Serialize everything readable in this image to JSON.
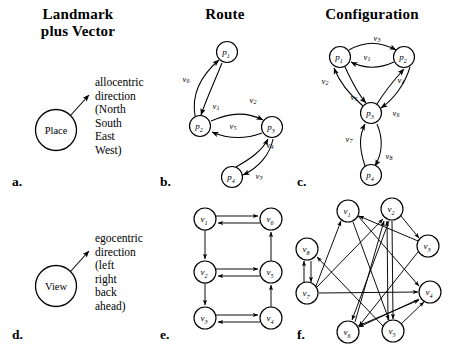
{
  "headers": {
    "landmark": "Landmark\nplus Vector",
    "route": "Route",
    "configuration": "Configuration"
  },
  "panel_labels": {
    "a": "a.",
    "b": "b.",
    "c": "c.",
    "d": "d.",
    "e": "e.",
    "f": "f."
  },
  "panel_a": {
    "node_label": "Place",
    "caption": "allocentric\ndirection\n(North\nSouth\nEast\nWest)"
  },
  "panel_d": {
    "node_label": "View",
    "caption": "egocentric\ndirection\n(left\nright\nback\nahead)"
  },
  "chart_data": [
    {
      "type": "diagram",
      "id": "panel_b",
      "title": "Route",
      "graph_kind": "directed-graph",
      "nodes": [
        {
          "id": "p1",
          "label": "p",
          "sub": "1",
          "x": 227,
          "y": 52
        },
        {
          "id": "p2",
          "label": "p",
          "sub": "2",
          "x": 200,
          "y": 126
        },
        {
          "id": "p3",
          "label": "p",
          "sub": "3",
          "x": 272,
          "y": 127
        },
        {
          "id": "p4",
          "label": "p",
          "sub": "4",
          "x": 232,
          "y": 177
        }
      ],
      "edges": [
        {
          "from": "p1",
          "to": "p2",
          "label": "v",
          "sub": "1"
        },
        {
          "from": "p2",
          "to": "p1",
          "label": "v",
          "sub": "6"
        },
        {
          "from": "p2",
          "to": "p3",
          "label": "v",
          "sub": "2"
        },
        {
          "from": "p3",
          "to": "p2",
          "label": "v",
          "sub": "5"
        },
        {
          "from": "p3",
          "to": "p4",
          "label": "v",
          "sub": "3"
        },
        {
          "from": "p4",
          "to": "p3",
          "label": "v",
          "sub": "4"
        }
      ],
      "edge_labels": [
        "v1",
        "v2",
        "v3",
        "v4",
        "v5",
        "v6"
      ]
    },
    {
      "type": "diagram",
      "id": "panel_c",
      "title": "Configuration",
      "graph_kind": "directed-graph",
      "nodes": [
        {
          "id": "p1",
          "label": "p",
          "sub": "1",
          "x": 340,
          "y": 57
        },
        {
          "id": "p2",
          "label": "p",
          "sub": "2",
          "x": 404,
          "y": 57
        },
        {
          "id": "p3",
          "label": "p",
          "sub": "3",
          "x": 371,
          "y": 113
        },
        {
          "id": "p4",
          "label": "p",
          "sub": "4",
          "x": 371,
          "y": 175
        }
      ],
      "edges": [
        {
          "from": "p1",
          "to": "p2",
          "label": "v",
          "sub": "3"
        },
        {
          "from": "p2",
          "to": "p1",
          "label": "v",
          "sub": "1"
        },
        {
          "from": "p3",
          "to": "p1",
          "label": "v",
          "sub": "2"
        },
        {
          "from": "p1",
          "to": "p3",
          "label": "v",
          "sub": "5"
        },
        {
          "from": "p3",
          "to": "p2",
          "label": "v",
          "sub": "4"
        },
        {
          "from": "p2",
          "to": "p3",
          "label": "v",
          "sub": "6"
        },
        {
          "from": "p4",
          "to": "p3",
          "label": "v",
          "sub": "7"
        },
        {
          "from": "p3",
          "to": "p4",
          "label": "v",
          "sub": "8"
        }
      ],
      "edge_labels": [
        "v1",
        "v2",
        "v3",
        "v4",
        "v5",
        "v6",
        "v7",
        "v8"
      ]
    },
    {
      "type": "diagram",
      "id": "panel_e",
      "title": "",
      "graph_kind": "directed-graph",
      "nodes": [
        {
          "id": "v1",
          "label": "v",
          "sub": "1",
          "x": 205,
          "y": 219
        },
        {
          "id": "v6",
          "label": "v",
          "sub": "6",
          "x": 271,
          "y": 219
        },
        {
          "id": "v2",
          "label": "v",
          "sub": "2",
          "x": 205,
          "y": 272
        },
        {
          "id": "v5",
          "label": "v",
          "sub": "5",
          "x": 271,
          "y": 272
        },
        {
          "id": "v3",
          "label": "v",
          "sub": "3",
          "x": 205,
          "y": 318
        },
        {
          "id": "v4",
          "label": "v",
          "sub": "4",
          "x": 271,
          "y": 318
        }
      ],
      "edges": [
        {
          "from": "v1",
          "to": "v6"
        },
        {
          "from": "v6",
          "to": "v1"
        },
        {
          "from": "v1",
          "to": "v2"
        },
        {
          "from": "v2",
          "to": "v5"
        },
        {
          "from": "v5",
          "to": "v2"
        },
        {
          "from": "v5",
          "to": "v6"
        },
        {
          "from": "v2",
          "to": "v3"
        },
        {
          "from": "v3",
          "to": "v4"
        },
        {
          "from": "v4",
          "to": "v3"
        },
        {
          "from": "v4",
          "to": "v5"
        }
      ]
    },
    {
      "type": "diagram",
      "id": "panel_f",
      "title": "",
      "graph_kind": "directed-graph",
      "nodes": [
        {
          "id": "v1",
          "label": "v",
          "sub": "1",
          "x": 348,
          "y": 211
        },
        {
          "id": "v2",
          "label": "v",
          "sub": "2",
          "x": 392,
          "y": 209
        },
        {
          "id": "v8",
          "label": "v",
          "sub": "8",
          "x": 307,
          "y": 249
        },
        {
          "id": "v3",
          "label": "v",
          "sub": "3",
          "x": 428,
          "y": 246
        },
        {
          "id": "v7",
          "label": "v",
          "sub": "7",
          "x": 307,
          "y": 293
        },
        {
          "id": "v4",
          "label": "v",
          "sub": "4",
          "x": 430,
          "y": 292
        },
        {
          "id": "v6",
          "label": "v",
          "sub": "6",
          "x": 348,
          "y": 332
        },
        {
          "id": "v5",
          "label": "v",
          "sub": "5",
          "x": 393,
          "y": 331
        }
      ],
      "edges": [
        {
          "from": "v8",
          "to": "v7"
        },
        {
          "from": "v7",
          "to": "v8"
        },
        {
          "from": "v7",
          "to": "v4"
        },
        {
          "from": "v7",
          "to": "v2"
        },
        {
          "from": "v7",
          "to": "v1"
        },
        {
          "from": "v1",
          "to": "v5"
        },
        {
          "from": "v1",
          "to": "v4"
        },
        {
          "from": "v2",
          "to": "v3"
        },
        {
          "from": "v2",
          "to": "v6"
        },
        {
          "from": "v2",
          "to": "v5"
        },
        {
          "from": "v3",
          "to": "v6"
        },
        {
          "from": "v3",
          "to": "v1"
        },
        {
          "from": "v4",
          "to": "v6"
        },
        {
          "from": "v5",
          "to": "v2"
        },
        {
          "from": "v5",
          "to": "v8"
        },
        {
          "from": "v6",
          "to": "v2"
        },
        {
          "from": "v6",
          "to": "v4"
        },
        {
          "from": "v5",
          "to": "v4"
        }
      ]
    }
  ]
}
